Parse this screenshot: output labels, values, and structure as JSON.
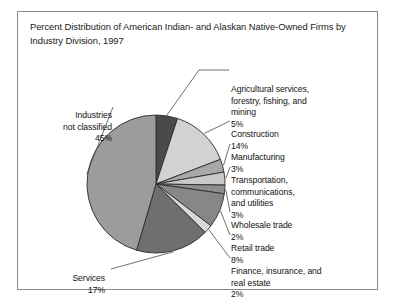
{
  "figure": {
    "title": "Percent Distribution of American Indian- and Alaskan Native-Owned Firms by Industry Division, 1997",
    "border_color": "#8a8a8a",
    "background": "#ffffff"
  },
  "chart_data": {
    "type": "pie",
    "title": "Percent Distribution of American Indian- and Alaskan Native-Owned Firms by Industry Division, 1997",
    "xlabel": "",
    "ylabel": "",
    "units": "percent",
    "legend_position": "callout-labels",
    "grid": false,
    "start_angle_deg": 0,
    "direction": "clockwise",
    "categories": [
      "Agricultural services, forestry, fishing, and mining",
      "Construction",
      "Manufacturing",
      "Transportation, communications, and utilities",
      "Wholesale trade",
      "Retail trade",
      "Finance, insurance, and real estate",
      "Services",
      "Industries not classified"
    ],
    "values": [
      5,
      14,
      3,
      3,
      2,
      8,
      2,
      17,
      45
    ],
    "value_labels": [
      "5%",
      "14%",
      "3%",
      "3%",
      "2%",
      "8%",
      "2%",
      "17%",
      "45%"
    ],
    "colors": [
      "#4a4a4a",
      "#d2d2d2",
      "#a8a8a8",
      "#c9c9c9",
      "#8f8f8f",
      "#878787",
      "#d8d8d8",
      "#6f6f6f",
      "#9c9c9c"
    ],
    "total": 99
  },
  "callouts": {
    "agricultural": {
      "name": "Agricultural services,\nforestry, fishing, and\nmining",
      "value": "5%"
    },
    "construction": {
      "name": "Construction",
      "value": "14%"
    },
    "manufacturing": {
      "name": "Manufacturing",
      "value": "3%"
    },
    "transportation": {
      "name": "Transportation,\ncommunications,\nand utilities",
      "value": "3%"
    },
    "wholesale": {
      "name": "Wholesale trade",
      "value": "2%"
    },
    "retail": {
      "name": "Retail trade",
      "value": "8%"
    },
    "finance": {
      "name": "Finance, insurance, and\nreal estate",
      "value": "2%"
    },
    "services": {
      "name": "Services",
      "value": "17%"
    },
    "unclassified": {
      "name": "Industries\nnot classified",
      "value": "45%"
    }
  }
}
